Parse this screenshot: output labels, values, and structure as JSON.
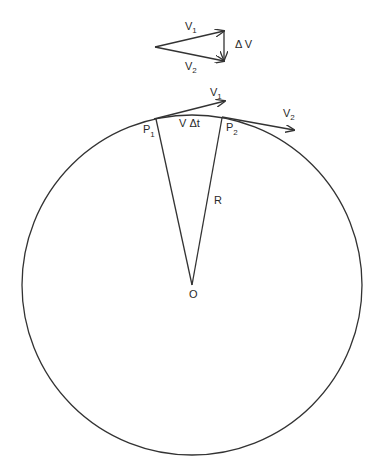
{
  "diagram": {
    "vector_triangle": {
      "v1_label": "V",
      "v1_sub": "1",
      "v2_label": "V",
      "v2_sub": "2",
      "dv_label": "Δ V"
    },
    "circle": {
      "p1_label": "P",
      "p1_sub": "1",
      "p2_label": "P",
      "p2_sub": "2",
      "arc_label": "V Δt",
      "radius_label": "R",
      "center_label": "O",
      "tangent1_label": "V",
      "tangent1_sub": "1",
      "tangent2_label": "V",
      "tangent2_sub": "2"
    },
    "colors": {
      "stroke": "#333333",
      "background": "#ffffff"
    }
  }
}
